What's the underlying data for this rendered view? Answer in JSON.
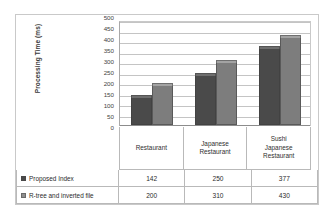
{
  "chart_data": {
    "type": "bar",
    "title": "",
    "xlabel": "",
    "ylabel": "Processing Time (ms)",
    "categories": [
      "Restaurant",
      "Japanese Restaurant",
      "Sushi Japanese Restaurant"
    ],
    "category_lines": [
      [
        "Restaurant"
      ],
      [
        "Japanese",
        "Restaurant"
      ],
      [
        "Sushi",
        "Japanese",
        "Restaurant"
      ]
    ],
    "series": [
      {
        "name": "Proposed Index",
        "values": [
          142,
          250,
          377
        ],
        "color": "#4a4a4a"
      },
      {
        "name": "R-tree and inverted file",
        "values": [
          200,
          310,
          430
        ],
        "color": "#7d7d7d"
      }
    ],
    "ylim": [
      0,
      500
    ],
    "ytick_step": 50,
    "yticks": [
      500,
      450,
      400,
      350,
      300,
      250,
      200,
      150,
      100,
      50,
      0
    ],
    "grid": true,
    "legend_position": "data-table-left-column",
    "data_table_visible": true
  },
  "icons": {
    "legend_marker": "square-swatch-icon"
  }
}
